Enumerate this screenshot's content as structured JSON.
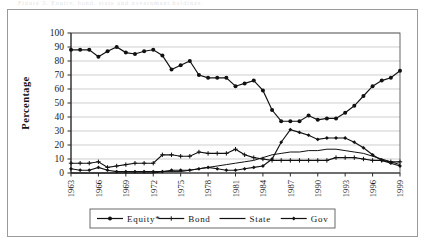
{
  "figure": {
    "caption_artifact": "Figure 3. Equity, bond, state and government holdings",
    "frame_color": "#9a9a9a",
    "background": "#ffffff"
  },
  "chart_data": {
    "type": "line",
    "title": "",
    "subtitle": "",
    "xlabel": "",
    "ylabel": "Percentage",
    "ylim": [
      0,
      100
    ],
    "ytick_step": 10,
    "ytick_labels": [
      "0",
      "10",
      "20",
      "30",
      "40",
      "50",
      "60",
      "70",
      "80",
      "90",
      "100"
    ],
    "yticks": [
      0,
      10,
      20,
      30,
      40,
      50,
      60,
      70,
      80,
      90,
      100
    ],
    "grid": true,
    "grid_axis": "y",
    "legend_position": "bottom",
    "xlim": [
      1963,
      1999
    ],
    "x": [
      1963,
      1964,
      1965,
      1966,
      1967,
      1968,
      1969,
      1970,
      1971,
      1972,
      1973,
      1974,
      1975,
      1976,
      1977,
      1978,
      1979,
      1980,
      1981,
      1982,
      1983,
      1984,
      1985,
      1986,
      1987,
      1988,
      1989,
      1990,
      1991,
      1992,
      1993,
      1994,
      1995,
      1996,
      1997,
      1998,
      1999
    ],
    "xtick_labels": [
      "1963",
      "1966",
      "1969",
      "1972",
      "1975",
      "1978",
      "1981",
      "1984",
      "1987",
      "1990",
      "1993",
      "1996",
      "1999"
    ],
    "xticks": [
      1963,
      1966,
      1969,
      1972,
      1975,
      1978,
      1981,
      1984,
      1987,
      1990,
      1993,
      1996,
      1999
    ],
    "xtick_rotation": 90,
    "series": [
      {
        "name": "Equity*",
        "marker": "filled-circle",
        "color": "#111111",
        "values": [
          88,
          88,
          88,
          83,
          87,
          90,
          86,
          85,
          87,
          88,
          84,
          74,
          77,
          80,
          70,
          68,
          68,
          68,
          62,
          64,
          66,
          59,
          45,
          37,
          37,
          37,
          41,
          38,
          39,
          39,
          43,
          48,
          55,
          62,
          66,
          68,
          73
        ]
      },
      {
        "name": "Bond",
        "marker": "plus",
        "color": "#111111",
        "values": [
          7,
          7,
          7,
          8,
          4,
          5,
          6,
          7,
          7,
          7,
          13,
          13,
          12,
          12,
          15,
          14,
          14,
          14,
          17,
          13,
          11,
          10,
          9,
          9,
          9,
          9,
          9,
          9,
          9,
          11,
          11,
          11,
          10,
          9,
          9,
          8,
          8
        ]
      },
      {
        "name": "State",
        "marker": "none",
        "color": "#111111",
        "values": [
          0,
          0,
          0,
          0,
          0,
          0,
          0,
          0,
          0,
          0,
          1,
          1,
          1,
          2,
          3,
          4,
          5,
          6,
          7,
          8,
          9,
          11,
          13,
          14,
          15,
          15,
          16,
          16,
          17,
          17,
          16,
          15,
          14,
          12,
          10,
          8,
          6
        ]
      },
      {
        "name": "Gov",
        "marker": "small-filled-diamond",
        "color": "#111111",
        "values": [
          3,
          2,
          2,
          4,
          2,
          1,
          1,
          1,
          1,
          1,
          1,
          2,
          2,
          2,
          3,
          4,
          3,
          2,
          2,
          3,
          4,
          5,
          10,
          22,
          31,
          29,
          27,
          24,
          25,
          25,
          25,
          22,
          18,
          13,
          9,
          7,
          5
        ]
      }
    ]
  },
  "legend": {
    "items": [
      {
        "label": "Equity*",
        "marker": "filled-circle"
      },
      {
        "label": "Bond",
        "marker": "plus"
      },
      {
        "label": "State",
        "marker": "none"
      },
      {
        "label": "Gov",
        "marker": "small-filled-diamond"
      }
    ]
  }
}
